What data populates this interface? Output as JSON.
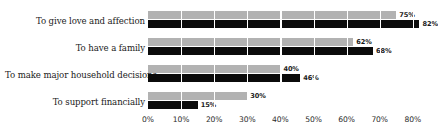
{
  "chart_data": {
    "type": "bar",
    "orientation": "horizontal",
    "title": "",
    "xlabel": "",
    "ylabel": "",
    "xlim": [
      0,
      80
    ],
    "grid": true,
    "legend": "none",
    "categories": [
      "To give love and affection",
      "To have a family",
      "To make major household decisions",
      "To support financially"
    ],
    "tick_labels": [
      "0%",
      "10%",
      "20%",
      "30%",
      "40%",
      "50%",
      "60%",
      "70%",
      "80%"
    ],
    "tick_values": [
      0,
      10,
      20,
      30,
      40,
      50,
      60,
      70,
      80
    ],
    "series": [
      {
        "name": "gray",
        "color": "#b2b2b2",
        "values": [
          75,
          62,
          40,
          30
        ],
        "labels": [
          "75%",
          "62%",
          "40%",
          "30%"
        ]
      },
      {
        "name": "black",
        "color": "#0b0b0b",
        "values": [
          82,
          68,
          46,
          15
        ],
        "labels": [
          "82%",
          "68%",
          "46%",
          "15%"
        ]
      }
    ]
  }
}
